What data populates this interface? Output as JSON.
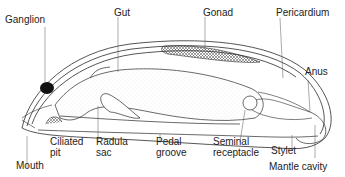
{
  "diagram": {
    "labels": {
      "ganglion": "Ganglion",
      "gut": "Gut",
      "gonad": "Gonad",
      "pericardium": "Pericardium",
      "anus": "Anus",
      "ciliated_pit": "Ciliated\npit",
      "radula_sac": "Radula\nsac",
      "pedal_groove": "Pedal\ngroove",
      "seminal_receptacle": "Seminal\nreceptacle",
      "stylet": "Stylet",
      "mouth": "Mouth",
      "mantle_cavity": "Mantle cavity"
    },
    "colors": {
      "line": "#2a2a2a",
      "stipple": "#d8d8d8",
      "ganglion_fill": "#111111",
      "background": "#ffffff"
    }
  }
}
